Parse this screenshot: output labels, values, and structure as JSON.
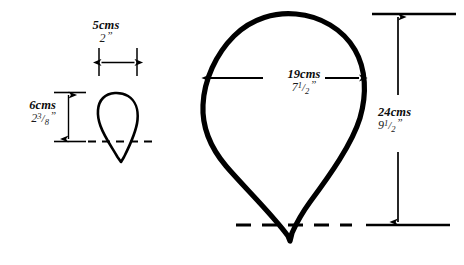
{
  "diagram": {
    "ink_color": "#000000",
    "background_color": "#ffffff",
    "shapes": [
      {
        "name": "small-teardrop",
        "label": "small pattern piece",
        "width_metric": "5cms",
        "width_imperial_whole": "2",
        "height_metric": "6cms",
        "height_imperial_whole": "2",
        "height_imperial_num": "3",
        "height_imperial_den": "8"
      },
      {
        "name": "large-teardrop",
        "label": "large pattern piece",
        "width_metric": "19cms",
        "width_imperial_whole": "7",
        "width_imperial_num": "1",
        "width_imperial_den": "2",
        "height_metric": "24cms",
        "height_imperial_whole": "9",
        "height_imperial_num": "1",
        "height_imperial_den": "2"
      }
    ]
  },
  "labels": {
    "small_width_metric": "5cms",
    "small_width_imperial_whole": "2",
    "small_height_metric": "6cms",
    "small_height_imperial_whole": "2",
    "small_height_imperial_num": "3",
    "small_height_imperial_den": "8",
    "large_width_metric": "19cms",
    "large_width_imperial_whole": "7",
    "large_width_imperial_num": "1",
    "large_width_imperial_den": "2",
    "large_height_metric": "24cms",
    "large_height_imperial_whole": "9",
    "large_height_imperial_num": "1",
    "large_height_imperial_den": "2"
  },
  "symbols": {
    "fraction_bar": "/",
    "inch_mark": "”"
  }
}
